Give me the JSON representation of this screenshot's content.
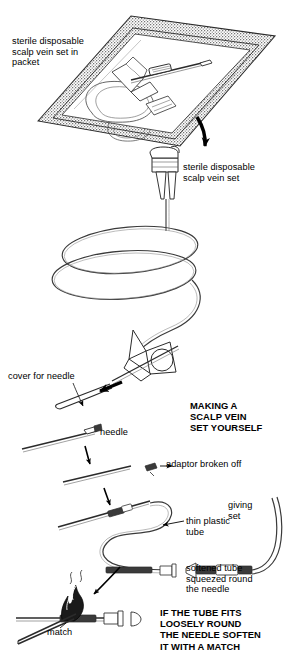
{
  "page": {
    "width": 290,
    "height": 663,
    "background_color": "#ffffff",
    "ink_color": "#1a1a1a",
    "packet_fill_color": "#b8b8b8"
  },
  "labels": {
    "packet": "sterile disposable\nscalp vein set in\npacket",
    "scalp_vein_set": "sterile disposable\nscalp vein set",
    "cover_for_needle": "cover for needle",
    "making_heading": "MAKING A\nSCALP VEIN\nSET YOURSELF",
    "needle": "needle",
    "adaptor_broken_off": "adaptor broken off",
    "thin_plastic_tube": "thin plastic\ntube",
    "giving_set": "giving\nset",
    "softened_tube": "softened tube\nsqueezed round\nthe needle",
    "if_the_tube_fits": "IF THE TUBE FITS\nLOOSELY ROUND\nTHE NEEDLE SOFTEN\nIT WITH A MATCH",
    "match": "match"
  },
  "figures": [
    {
      "id": "packet-figure",
      "name": "sterile-packet-with-scalp-vein-set",
      "description": "Stippled sterile peel pouch drawn in perspective containing a coiled butterfly scalp vein set"
    },
    {
      "id": "scalp-vein-set-figure",
      "name": "scalp-vein-set-assembly",
      "description": "Butterfly needle hub with long coiled tubing, winged grip and needle cover"
    },
    {
      "id": "homemade-figure",
      "name": "improvised-scalp-vein-set",
      "description": "Needle with adaptor broken off joined to thin plastic tube leading to a giving set"
    },
    {
      "id": "match-figure",
      "name": "needle-heated-over-match-flame",
      "description": "Lit match flame under the plastic tube on the needle to soften it"
    }
  ],
  "arrows": [
    {
      "name": "packet-to-set-arrow",
      "direction": "down"
    },
    {
      "name": "cover-pull-off-arrow",
      "direction": "left"
    },
    {
      "name": "needle-step-arrow-1",
      "direction": "down"
    },
    {
      "name": "needle-step-arrow-2",
      "direction": "down"
    },
    {
      "name": "flame-pointer-arrow",
      "direction": "down-left"
    }
  ]
}
